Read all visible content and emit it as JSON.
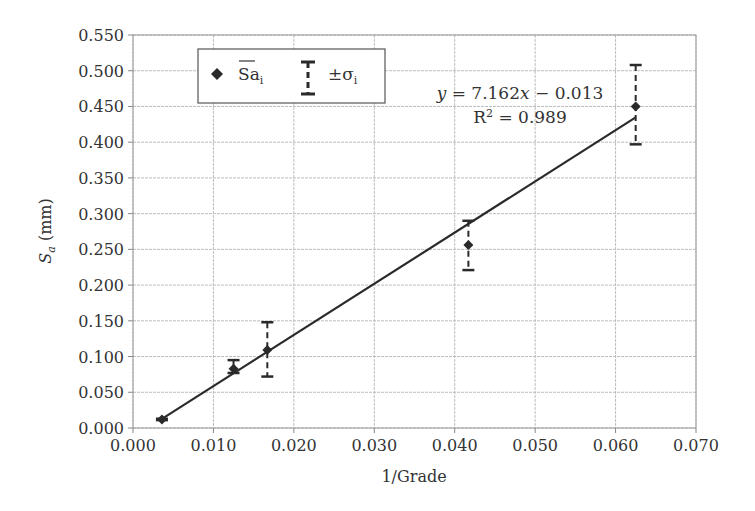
{
  "chart_data": {
    "type": "scatter",
    "title": "",
    "xlabel": "1/Grade",
    "ylabel": "S_a (mm)",
    "ylabel_main": "S",
    "ylabel_sub": "a",
    "ylabel_unit": " (mm)",
    "xlim": [
      0.0,
      0.07
    ],
    "ylim": [
      0.0,
      0.55
    ],
    "x_ticks": [
      "0.000",
      "0.010",
      "0.020",
      "0.030",
      "0.040",
      "0.050",
      "0.060",
      "0.070"
    ],
    "y_ticks": [
      "0.000",
      "0.050",
      "0.100",
      "0.150",
      "0.200",
      "0.250",
      "0.300",
      "0.350",
      "0.400",
      "0.450",
      "0.500",
      "0.550"
    ],
    "grid": true,
    "legend_position": "upper-left",
    "series": [
      {
        "name": "Sa_i (mean)",
        "marker": "diamond",
        "points": [
          {
            "x": 0.0036,
            "y": 0.012,
            "err_plus": 0.013,
            "err_minus": 0.011
          },
          {
            "x": 0.0125,
            "y": 0.083,
            "err_plus": 0.095,
            "err_minus": 0.077
          },
          {
            "x": 0.0167,
            "y": 0.109,
            "err_plus": 0.148,
            "err_minus": 0.072
          },
          {
            "x": 0.0417,
            "y": 0.256,
            "err_plus": 0.29,
            "err_minus": 0.221
          },
          {
            "x": 0.0625,
            "y": 0.45,
            "err_plus": 0.508,
            "err_minus": 0.397
          }
        ]
      }
    ],
    "trendline": {
      "slope": 7.162,
      "intercept": -0.013,
      "x_start": 0.0036,
      "x_end": 0.0625,
      "equation_label": "y = 7.162x − 0.013",
      "r2_label": "R² = 0.989"
    },
    "legend": {
      "entries": [
        {
          "symbol": "diamond",
          "label": "Sa",
          "subscript": "i",
          "overline": true
        },
        {
          "symbol": "error-bar",
          "label": "±σ",
          "subscript": "i"
        }
      ]
    },
    "annotations": {
      "eq_y": "y",
      "eq_mid": " = 7.162",
      "eq_x": "x",
      "eq_end": " − 0.013",
      "r2_text": "R",
      "r2_sup": "2",
      "r2_val": " = 0.989"
    }
  }
}
